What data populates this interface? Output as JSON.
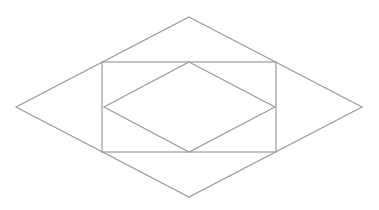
{
  "diagram": {
    "stroke_color": "#9a9a9a",
    "background": "#ffffff",
    "shapes": [
      {
        "id": "outer-diamond",
        "type": "polygon",
        "points": [
          [
            189,
            17
          ],
          [
            362,
            107
          ],
          [
            189,
            197
          ],
          [
            16,
            107
          ]
        ]
      },
      {
        "id": "rectangle",
        "type": "rect",
        "x": 102,
        "y": 62,
        "width": 174,
        "height": 90
      },
      {
        "id": "inner-diamond",
        "type": "polygon",
        "points": [
          [
            189,
            62
          ],
          [
            275,
            107
          ],
          [
            189,
            152
          ],
          [
            104,
            107
          ]
        ]
      }
    ]
  }
}
